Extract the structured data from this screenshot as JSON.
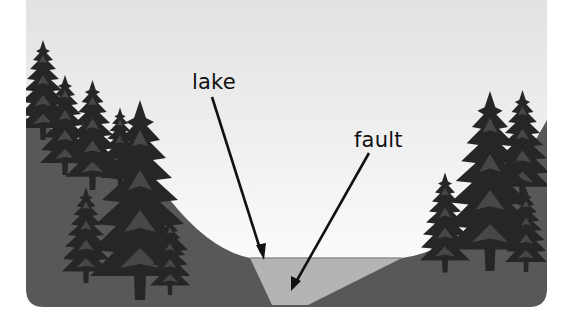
{
  "diagram": {
    "labels": {
      "lake": "lake",
      "fault": "fault"
    },
    "colors": {
      "sky_top": "#e4e4e4",
      "sky_bottom": "#ffffff",
      "ground": "#585858",
      "lake": "#b4b4b4",
      "tree": "#262626",
      "tree_highlight": "#4a4a4a",
      "arrow": "#111111"
    }
  }
}
